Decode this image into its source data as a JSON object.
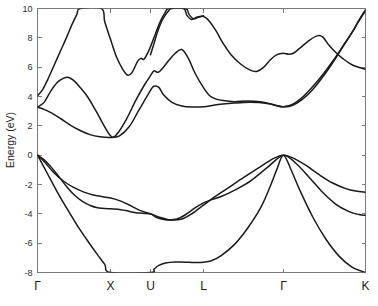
{
  "chart_data": {
    "type": "line",
    "title": "",
    "subtitle": "",
    "xlabel": "",
    "ylabel": "Energy (eV)",
    "ylim": [
      -8,
      10
    ],
    "xlim": [
      0,
      1
    ],
    "grid": false,
    "legend": null,
    "legend_position": "none",
    "yticks": [
      -8,
      -6,
      -4,
      -2,
      0,
      2,
      4,
      6,
      8,
      10
    ],
    "ytick_labels": [
      "-8",
      "-6",
      "-4",
      "-2",
      "0",
      "2",
      "4",
      "6",
      "8",
      "10"
    ],
    "xtick_labels": [
      "Γ",
      "X",
      "U",
      "L",
      "Γ",
      "K"
    ],
    "xtick_positions": [
      0.0,
      0.2226,
      0.3445,
      0.5061,
      0.75,
      1.0
    ],
    "high_symmetry_points": [
      {
        "label": "Γ",
        "position": 0.0
      },
      {
        "label": "X",
        "position": 0.2226
      },
      {
        "label": "U",
        "position": 0.3445
      },
      {
        "label": "L",
        "position": 0.5061
      },
      {
        "label": "Γ",
        "position": 0.75
      },
      {
        "label": "K",
        "position": 1.0
      }
    ],
    "line_color": "#1a1a1a",
    "axis_color": "#7a7a7a",
    "background_color": "#ffffff",
    "series": [
      {
        "name": "valence-band-1",
        "points": [
          [
            0.0,
            0.0
          ],
          [
            0.022,
            -0.35
          ],
          [
            0.045,
            -0.9
          ],
          [
            0.068,
            -1.55
          ],
          [
            0.091,
            -2.2
          ],
          [
            0.114,
            -2.75
          ],
          [
            0.137,
            -3.15
          ],
          [
            0.16,
            -3.42
          ],
          [
            0.183,
            -3.58
          ],
          [
            0.2226,
            -3.66
          ],
          [
            0.245,
            -3.68
          ],
          [
            0.27,
            -3.78
          ],
          [
            0.3,
            -3.93
          ],
          [
            0.3445,
            -4.02
          ],
          [
            0.36,
            -4.22
          ],
          [
            0.385,
            -4.38
          ],
          [
            0.41,
            -4.42
          ],
          [
            0.44,
            -4.35
          ],
          [
            0.47,
            -4.0
          ],
          [
            0.5061,
            -3.4
          ],
          [
            0.54,
            -2.85
          ],
          [
            0.58,
            -2.25
          ],
          [
            0.63,
            -1.5
          ],
          [
            0.68,
            -0.78
          ],
          [
            0.72,
            -0.22
          ],
          [
            0.75,
            0.0
          ],
          [
            0.78,
            -0.2
          ],
          [
            0.82,
            -0.72
          ],
          [
            0.86,
            -1.35
          ],
          [
            0.9,
            -1.9
          ],
          [
            0.94,
            -2.28
          ],
          [
            0.97,
            -2.45
          ],
          [
            1.0,
            -2.52
          ]
        ]
      },
      {
        "name": "valence-band-2",
        "points": [
          [
            0.0,
            0.0
          ],
          [
            0.025,
            -0.55
          ],
          [
            0.05,
            -1.2
          ],
          [
            0.08,
            -1.78
          ],
          [
            0.11,
            -2.2
          ],
          [
            0.14,
            -2.5
          ],
          [
            0.17,
            -2.72
          ],
          [
            0.2226,
            -2.92
          ],
          [
            0.25,
            -3.1
          ],
          [
            0.28,
            -3.4
          ],
          [
            0.31,
            -3.75
          ],
          [
            0.3445,
            -4.0
          ],
          [
            0.375,
            -4.25
          ],
          [
            0.4,
            -4.4
          ],
          [
            0.425,
            -4.35
          ],
          [
            0.45,
            -4.08
          ],
          [
            0.48,
            -3.6
          ],
          [
            0.5061,
            -3.25
          ],
          [
            0.53,
            -3.05
          ],
          [
            0.56,
            -2.82
          ],
          [
            0.6,
            -2.4
          ],
          [
            0.65,
            -1.75
          ],
          [
            0.7,
            -0.85
          ],
          [
            0.75,
            0.0
          ],
          [
            0.79,
            -0.6
          ],
          [
            0.83,
            -1.55
          ],
          [
            0.87,
            -2.55
          ],
          [
            0.91,
            -3.35
          ],
          [
            0.95,
            -3.85
          ],
          [
            0.98,
            -4.05
          ],
          [
            1.0,
            -4.1
          ]
        ]
      },
      {
        "name": "valence-band-3",
        "points": [
          [
            0.0,
            0.0
          ],
          [
            0.03,
            -1.25
          ],
          [
            0.06,
            -2.5
          ],
          [
            0.09,
            -3.65
          ],
          [
            0.12,
            -4.75
          ],
          [
            0.15,
            -5.75
          ],
          [
            0.18,
            -6.7
          ],
          [
            0.205,
            -7.45
          ],
          [
            0.2226,
            -8.0
          ],
          [
            0.3445,
            -8.0
          ],
          [
            0.355,
            -7.78
          ],
          [
            0.37,
            -7.52
          ],
          [
            0.39,
            -7.35
          ],
          [
            0.42,
            -7.28
          ],
          [
            0.45,
            -7.3
          ],
          [
            0.48,
            -7.32
          ],
          [
            0.5061,
            -7.3
          ],
          [
            0.53,
            -7.2
          ],
          [
            0.56,
            -6.85
          ],
          [
            0.6,
            -6.1
          ],
          [
            0.64,
            -5.0
          ],
          [
            0.68,
            -3.6
          ],
          [
            0.71,
            -2.1
          ],
          [
            0.73,
            -0.95
          ],
          [
            0.75,
            0.0
          ],
          [
            0.775,
            -1.1
          ],
          [
            0.8,
            -2.4
          ],
          [
            0.84,
            -4.25
          ],
          [
            0.88,
            -5.75
          ],
          [
            0.92,
            -6.9
          ],
          [
            0.96,
            -7.65
          ],
          [
            1.0,
            -8.0
          ]
        ]
      },
      {
        "name": "conduction-band-1",
        "points": [
          [
            0.0,
            3.28
          ],
          [
            0.02,
            3.12
          ],
          [
            0.045,
            2.85
          ],
          [
            0.07,
            2.5
          ],
          [
            0.1,
            2.05
          ],
          [
            0.13,
            1.68
          ],
          [
            0.16,
            1.4
          ],
          [
            0.19,
            1.25
          ],
          [
            0.2226,
            1.2
          ],
          [
            0.25,
            1.32
          ],
          [
            0.28,
            1.95
          ],
          [
            0.31,
            3.1
          ],
          [
            0.3445,
            4.42
          ],
          [
            0.355,
            4.7
          ],
          [
            0.37,
            4.62
          ],
          [
            0.385,
            4.1
          ],
          [
            0.41,
            3.6
          ],
          [
            0.44,
            3.35
          ],
          [
            0.47,
            3.28
          ],
          [
            0.5061,
            3.3
          ],
          [
            0.55,
            3.45
          ],
          [
            0.6,
            3.55
          ],
          [
            0.65,
            3.6
          ],
          [
            0.7,
            3.52
          ],
          [
            0.75,
            3.3
          ],
          [
            0.78,
            3.42
          ],
          [
            0.81,
            3.85
          ],
          [
            0.84,
            4.5
          ],
          [
            0.87,
            5.35
          ],
          [
            0.9,
            6.3
          ],
          [
            0.93,
            7.35
          ],
          [
            0.96,
            8.4
          ],
          [
            0.98,
            9.2
          ],
          [
            1.0,
            9.9
          ]
        ]
      },
      {
        "name": "conduction-band-2",
        "points": [
          [
            0.0,
            3.28
          ],
          [
            0.02,
            3.6
          ],
          [
            0.04,
            4.35
          ],
          [
            0.06,
            4.95
          ],
          [
            0.08,
            5.25
          ],
          [
            0.095,
            5.3
          ],
          [
            0.11,
            5.1
          ],
          [
            0.13,
            4.62
          ],
          [
            0.155,
            3.9
          ],
          [
            0.18,
            2.95
          ],
          [
            0.2226,
            1.32
          ],
          [
            0.245,
            1.52
          ],
          [
            0.27,
            2.4
          ],
          [
            0.3,
            3.75
          ],
          [
            0.325,
            4.75
          ],
          [
            0.3445,
            5.42
          ],
          [
            0.355,
            5.75
          ],
          [
            0.368,
            5.65
          ],
          [
            0.382,
            5.95
          ],
          [
            0.4,
            6.45
          ],
          [
            0.42,
            6.95
          ],
          [
            0.44,
            7.2
          ],
          [
            0.46,
            6.6
          ],
          [
            0.48,
            5.6
          ],
          [
            0.5061,
            4.6
          ],
          [
            0.525,
            4.05
          ],
          [
            0.545,
            3.82
          ],
          [
            0.565,
            3.72
          ],
          [
            0.6,
            3.65
          ],
          [
            0.64,
            3.7
          ],
          [
            0.68,
            3.65
          ],
          [
            0.71,
            3.5
          ],
          [
            0.75,
            3.3
          ],
          [
            0.78,
            3.5
          ],
          [
            0.81,
            4.0
          ],
          [
            0.84,
            4.7
          ],
          [
            0.87,
            5.5
          ],
          [
            0.9,
            6.4
          ],
          [
            0.93,
            7.4
          ],
          [
            0.96,
            8.4
          ],
          [
            0.98,
            9.15
          ],
          [
            1.0,
            9.85
          ]
        ]
      },
      {
        "name": "conduction-band-3",
        "points": [
          [
            0.0,
            4.05
          ],
          [
            0.015,
            4.45
          ],
          [
            0.03,
            5.1
          ],
          [
            0.05,
            6.1
          ],
          [
            0.07,
            7.1
          ],
          [
            0.09,
            8.1
          ],
          [
            0.105,
            8.9
          ],
          [
            0.12,
            9.6
          ],
          [
            0.13,
            10.0
          ],
          [
            0.195,
            10.0
          ],
          [
            0.205,
            9.1
          ],
          [
            0.2226,
            7.9
          ],
          [
            0.24,
            6.75
          ],
          [
            0.26,
            5.85
          ],
          [
            0.275,
            5.45
          ],
          [
            0.29,
            5.7
          ],
          [
            0.305,
            6.4
          ],
          [
            0.315,
            6.6
          ],
          [
            0.325,
            6.55
          ],
          [
            0.34,
            7.15
          ],
          [
            0.3445,
            7.4
          ],
          [
            0.36,
            8.3
          ],
          [
            0.375,
            9.15
          ],
          [
            0.39,
            9.75
          ],
          [
            0.4,
            10.0
          ],
          [
            0.445,
            10.0
          ],
          [
            0.455,
            9.55
          ],
          [
            0.47,
            9.25
          ],
          [
            0.485,
            9.4
          ],
          [
            0.5061,
            9.45
          ],
          [
            0.525,
            9.1
          ],
          [
            0.545,
            8.45
          ],
          [
            0.565,
            7.65
          ],
          [
            0.59,
            6.85
          ],
          [
            0.62,
            6.2
          ],
          [
            0.65,
            5.78
          ],
          [
            0.67,
            5.72
          ],
          [
            0.69,
            6.0
          ],
          [
            0.71,
            6.5
          ],
          [
            0.73,
            6.85
          ],
          [
            0.75,
            6.95
          ],
          [
            0.765,
            6.88
          ],
          [
            0.78,
            6.95
          ],
          [
            0.8,
            7.3
          ],
          [
            0.83,
            7.85
          ],
          [
            0.855,
            8.15
          ],
          [
            0.87,
            8.05
          ],
          [
            0.885,
            7.6
          ],
          [
            0.905,
            7.1
          ],
          [
            0.93,
            6.6
          ],
          [
            0.96,
            6.15
          ],
          [
            1.0,
            5.85
          ]
        ]
      },
      {
        "name": "conduction-band-4",
        "points": [
          [
            0.3445,
            6.85
          ],
          [
            0.355,
            7.6
          ],
          [
            0.365,
            8.35
          ],
          [
            0.375,
            8.95
          ],
          [
            0.385,
            9.4
          ],
          [
            0.4,
            9.85
          ],
          [
            0.41,
            10.0
          ],
          [
            0.452,
            10.0
          ],
          [
            0.462,
            9.6
          ],
          [
            0.475,
            9.3
          ],
          [
            0.49,
            9.4
          ],
          [
            0.5061,
            9.5
          ]
        ]
      }
    ]
  },
  "axes": {
    "y_axis_label": "Energy (eV)",
    "y_min_label": "-8",
    "y_max_label": "10"
  }
}
